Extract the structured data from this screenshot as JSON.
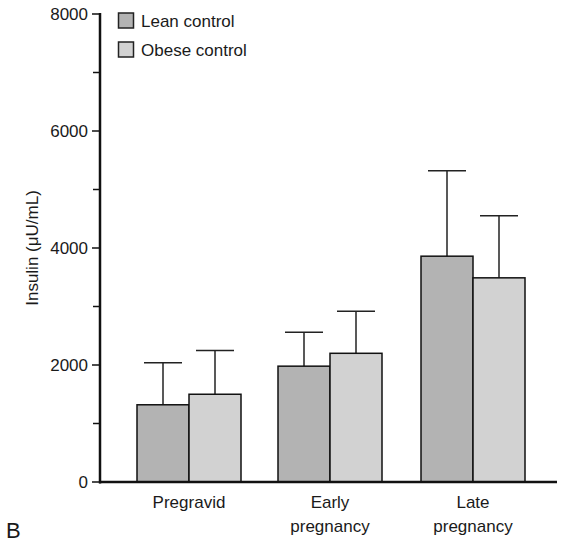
{
  "chart_data": {
    "type": "bar",
    "title": "",
    "panel_label": "B",
    "xlabel": "",
    "ylabel": "Insulin (μU/mL)",
    "ylim": [
      0,
      8000
    ],
    "yticks": [
      0,
      2000,
      4000,
      6000,
      8000
    ],
    "ytick_labels": [
      "0",
      "2000",
      "4000",
      "6000",
      "8000"
    ],
    "minor_yticks": [
      1000,
      3000,
      5000,
      7000
    ],
    "grid": false,
    "legend_position": "top-left",
    "categories": [
      "Pregravid",
      "Early pregnancy",
      "Late pregnancy"
    ],
    "category_labels": [
      [
        "Pregravid"
      ],
      [
        "Early",
        "pregnancy"
      ],
      [
        "Late",
        "pregnancy"
      ]
    ],
    "series": [
      {
        "name": "Lean control",
        "color": "#b3b3b3",
        "values": [
          1320,
          1980,
          3860
        ],
        "error_upper": [
          2040,
          2560,
          5320
        ]
      },
      {
        "name": "Obese control",
        "color": "#d2d2d2",
        "values": [
          1500,
          2200,
          3490
        ],
        "error_upper": [
          2250,
          2920,
          4550
        ]
      }
    ]
  }
}
